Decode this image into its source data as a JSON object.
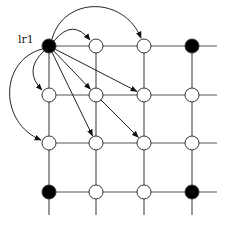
{
  "diagram": {
    "title": "",
    "label": "lr1",
    "columns_x": [
      49,
      96,
      144,
      192
    ],
    "rows_y": [
      46,
      95,
      143,
      192
    ],
    "grid_extent": {
      "right": 217,
      "bottom": 215,
      "left_start": 49,
      "top_start": 46
    },
    "nodes": [
      {
        "id": "n00",
        "col": 0,
        "row": 0,
        "fill": "black",
        "label": "lr1"
      },
      {
        "id": "n10",
        "col": 1,
        "row": 0,
        "fill": "white"
      },
      {
        "id": "n20",
        "col": 2,
        "row": 0,
        "fill": "white"
      },
      {
        "id": "n30",
        "col": 3,
        "row": 0,
        "fill": "black"
      },
      {
        "id": "n01",
        "col": 0,
        "row": 1,
        "fill": "white"
      },
      {
        "id": "n11",
        "col": 1,
        "row": 1,
        "fill": "white"
      },
      {
        "id": "n21",
        "col": 2,
        "row": 1,
        "fill": "white"
      },
      {
        "id": "n31",
        "col": 3,
        "row": 1,
        "fill": "white"
      },
      {
        "id": "n02",
        "col": 0,
        "row": 2,
        "fill": "white"
      },
      {
        "id": "n12",
        "col": 1,
        "row": 2,
        "fill": "white"
      },
      {
        "id": "n22",
        "col": 2,
        "row": 2,
        "fill": "white"
      },
      {
        "id": "n32",
        "col": 3,
        "row": 2,
        "fill": "white"
      },
      {
        "id": "n03",
        "col": 0,
        "row": 3,
        "fill": "black"
      },
      {
        "id": "n13",
        "col": 1,
        "row": 3,
        "fill": "white"
      },
      {
        "id": "n23",
        "col": 2,
        "row": 3,
        "fill": "white"
      },
      {
        "id": "n33",
        "col": 3,
        "row": 3,
        "fill": "black"
      }
    ],
    "edges": [
      {
        "from": "n00",
        "to": "n10",
        "style": "curved-up"
      },
      {
        "from": "n00",
        "to": "n20",
        "style": "curved-up-large"
      },
      {
        "from": "n00",
        "to": "n01",
        "style": "curved-left"
      },
      {
        "from": "n00",
        "to": "n02",
        "style": "curved-left-large"
      },
      {
        "from": "n00",
        "to": "n11",
        "style": "straight"
      },
      {
        "from": "n00",
        "to": "n21",
        "style": "straight"
      },
      {
        "from": "n00",
        "to": "n12",
        "style": "straight"
      },
      {
        "from": "n11",
        "to": "n22",
        "style": "straight"
      }
    ],
    "colors": {
      "line": "#555555",
      "node_stroke": "#333333",
      "filled": "#000000",
      "empty": "#ffffff"
    }
  }
}
